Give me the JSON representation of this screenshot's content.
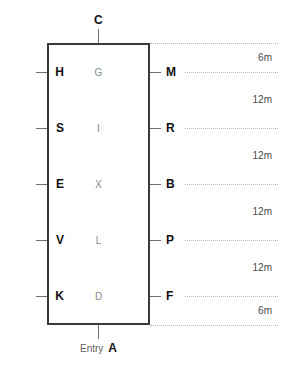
{
  "diagram": {
    "type": "vertical-shaft-section",
    "background_color": "#ffffff",
    "box_stroke_color": "#3a3a3a",
    "rule_color": "#b4b4b4",
    "top_node": {
      "label": "C"
    },
    "entry": {
      "caption": "Entry",
      "label": "A"
    },
    "levels": [
      {
        "left": "H",
        "inner": "G",
        "right": "M"
      },
      {
        "left": "S",
        "inner": "I",
        "right": "R"
      },
      {
        "left": "E",
        "inner": "X",
        "right": "B"
      },
      {
        "left": "V",
        "inner": "L",
        "right": "P"
      },
      {
        "left": "K",
        "inner": "D",
        "right": "F"
      }
    ],
    "depths": [
      {
        "value": "6m"
      },
      {
        "value": "12m"
      },
      {
        "value": "12m"
      },
      {
        "value": "12m"
      },
      {
        "value": "12m"
      },
      {
        "value": "6m"
      }
    ]
  }
}
